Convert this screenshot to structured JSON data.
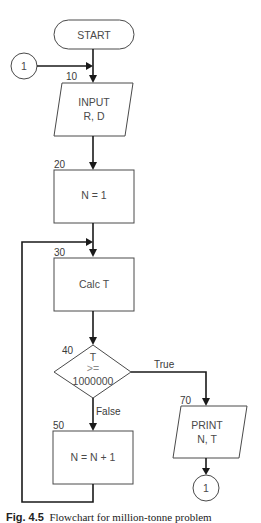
{
  "diagram": {
    "type": "flowchart",
    "nodes": {
      "start": {
        "shape": "terminal",
        "label": "START"
      },
      "connector_in": {
        "shape": "connector",
        "label": "1"
      },
      "input": {
        "shape": "io",
        "step": "10",
        "line1": "INPUT",
        "line2": "R, D"
      },
      "init": {
        "shape": "process",
        "step": "20",
        "label": "N = 1"
      },
      "calc": {
        "shape": "process",
        "step": "30",
        "label": "Calc T"
      },
      "decision": {
        "shape": "decision",
        "step": "40",
        "line1": "T",
        "line2": ">=",
        "line3": "1000000"
      },
      "increment": {
        "shape": "process",
        "step": "50",
        "label": "N = N + 1"
      },
      "print": {
        "shape": "io",
        "step": "70",
        "line1": "PRINT",
        "line2": "N, T"
      },
      "connector_out": {
        "shape": "connector",
        "label": "1"
      }
    },
    "edges": {
      "true_label": "True",
      "false_label": "False"
    }
  },
  "caption": {
    "fig": "Fig. 4.5",
    "text": "Flowchart for million-tonne problem"
  },
  "colors": {
    "line": "#1a1a1a",
    "shape_stroke": "#4a4a4a",
    "background": "#ffffff"
  }
}
